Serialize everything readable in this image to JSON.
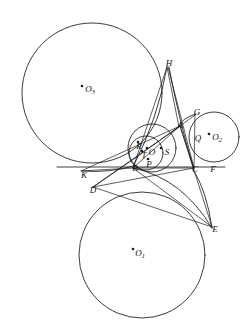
{
  "figure": {
    "background_color": "#ffffff",
    "stroke_color": "#1a1a1a",
    "width": 245,
    "height": 330
  },
  "circles": [
    {
      "name": "O1",
      "label": "O",
      "subscript": "1",
      "cx": 142,
      "cy": 255,
      "r": 63,
      "center_label_x": 140,
      "center_label_y": 254,
      "dot_x": 133,
      "dot_y": 249
    },
    {
      "name": "O2",
      "label": "O",
      "subscript": "2",
      "cx": 214,
      "cy": 137,
      "r": 25,
      "center_label_x": 217,
      "center_label_y": 138,
      "dot_x": 209,
      "dot_y": 134
    },
    {
      "name": "O3",
      "label": "O",
      "subscript": "3",
      "cx": 92,
      "cy": 93,
      "r": 70,
      "center_label_x": 90,
      "center_label_y": 90,
      "dot_x": 82,
      "dot_y": 86
    },
    {
      "name": "O",
      "label": "O",
      "subscript": "",
      "cx": 152,
      "cy": 148,
      "r": 24,
      "center_label_x": 152,
      "center_label_y": 152,
      "dot_x": 147,
      "dot_y": 147
    }
  ],
  "points": [
    {
      "id": "H",
      "label": "H",
      "x": 169,
      "y": 63
    },
    {
      "id": "G",
      "label": "G",
      "x": 197,
      "y": 112
    },
    {
      "id": "A",
      "label": "A",
      "x": 180,
      "y": 125
    },
    {
      "id": "Q",
      "label": "Q",
      "x": 198,
      "y": 138
    },
    {
      "id": "R",
      "label": "R",
      "x": 139,
      "y": 146
    },
    {
      "id": "T",
      "label": "T",
      "x": 144,
      "y": 155
    },
    {
      "id": "S",
      "label": "S",
      "x": 166,
      "y": 152
    },
    {
      "id": "P",
      "label": "P",
      "x": 148,
      "y": 164
    },
    {
      "id": "B",
      "label": "B",
      "x": 135,
      "y": 167
    },
    {
      "id": "C",
      "label": "C",
      "x": 195,
      "y": 168
    },
    {
      "id": "F",
      "label": "F",
      "x": 212,
      "y": 168
    },
    {
      "id": "K",
      "label": "K",
      "x": 84,
      "y": 174
    },
    {
      "id": "D",
      "label": "D",
      "x": 93,
      "y": 189
    },
    {
      "id": "E",
      "label": "E",
      "x": 214,
      "y": 229
    }
  ],
  "segments": [
    {
      "name": "line-K-F",
      "from": "K",
      "to": "F"
    },
    {
      "name": "line-H-B",
      "from": "H",
      "to": "B"
    },
    {
      "name": "line-H-C",
      "from": "H",
      "to": "C"
    },
    {
      "name": "line-H-A",
      "from": "H",
      "to": "A"
    },
    {
      "name": "line-D-A",
      "from": "D",
      "to": "A"
    },
    {
      "name": "line-D-E",
      "from": "D",
      "to": "E"
    },
    {
      "name": "line-D-C",
      "from": "D",
      "to": "C"
    },
    {
      "name": "line-E-B",
      "from": "E",
      "to": "B"
    },
    {
      "name": "line-E-A",
      "from": "E",
      "to": "A"
    },
    {
      "name": "line-A-C",
      "from": "A",
      "to": "C"
    },
    {
      "name": "line-A-G",
      "from": "A",
      "to": "G"
    },
    {
      "name": "line-A-B",
      "from": "A",
      "to": "B"
    },
    {
      "name": "line-B-C",
      "from": "B",
      "to": "C"
    },
    {
      "name": "line-G-C",
      "from": "G",
      "to": "C"
    },
    {
      "name": "line-K-B",
      "from": "K",
      "to": "B"
    },
    {
      "name": "line-K-A",
      "from": "K",
      "to": "A"
    }
  ],
  "arcs": [
    {
      "name": "arc-K-B-via-D",
      "d": "M 84,172 Q 112,172 133,165"
    },
    {
      "name": "arc-D-to-A",
      "d": "M 93,187 Q 134,160 179,126"
    },
    {
      "name": "arc-B-E",
      "d": "M 133,168 Q 180,180 212,228"
    },
    {
      "name": "arc-C-E",
      "d": "M 193,168 Q 206,192 212,228"
    },
    {
      "name": "arc-H-down",
      "d": "M 168,66 Q 160,120 137,164"
    }
  ]
}
